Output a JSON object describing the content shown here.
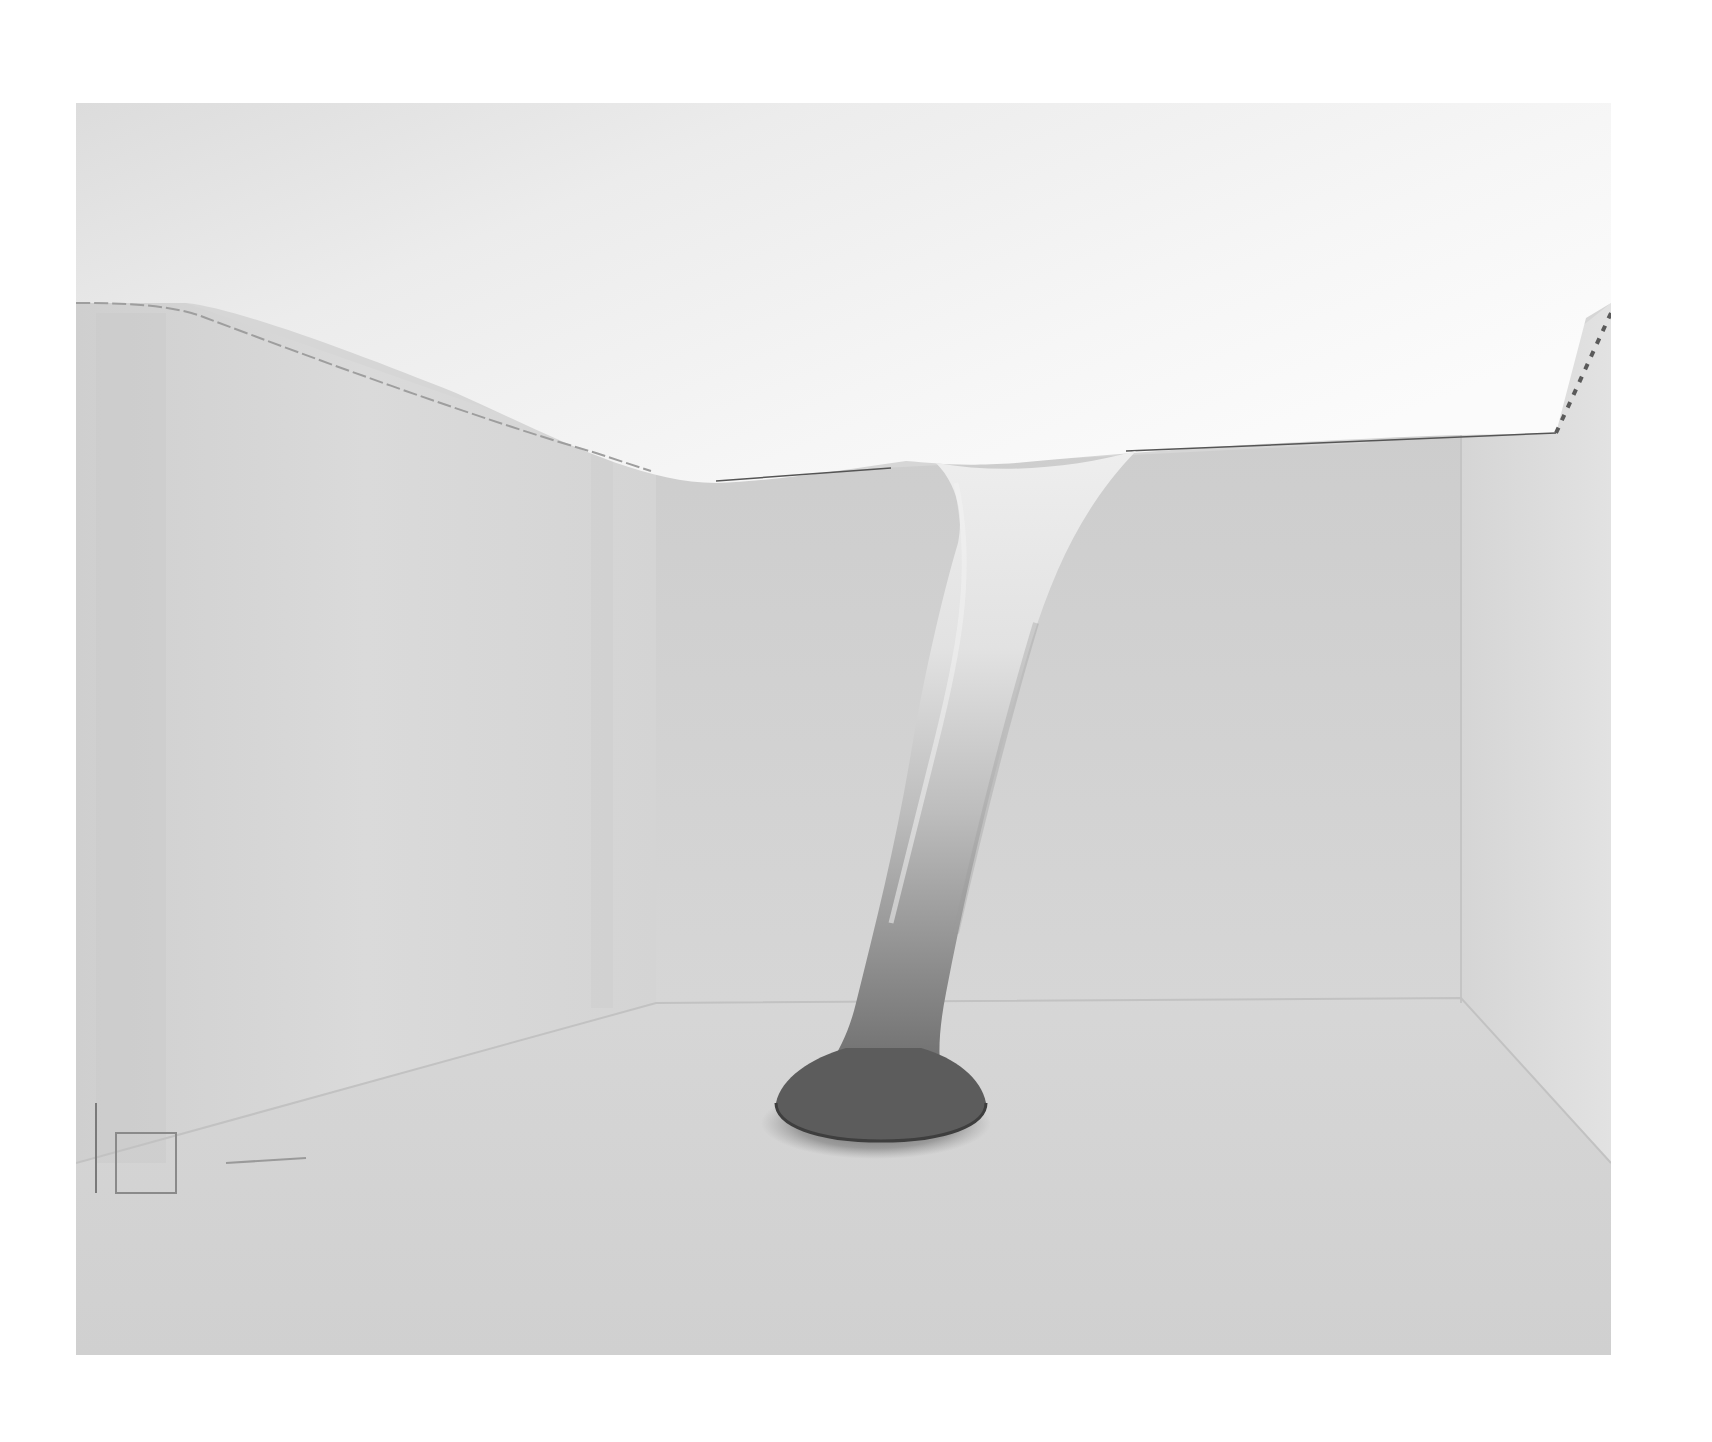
{
  "page": {
    "background": "#ffffff",
    "alt": "Black-and-white photograph of an empty white room with stretched fabric funnelling from the ceiling down to a dark weighted base on the floor"
  },
  "photo": {
    "frame": {
      "x": 76,
      "y": 103,
      "width": 1535,
      "height": 1252
    },
    "tones": {
      "ceiling_light": "#f4f4f4",
      "ceiling_mid": "#e6e6e6",
      "wall_left": "#d9d9d9",
      "wall_back": "#d3d3d3",
      "wall_right": "#dcdcdc",
      "floor": "#d4d4d4",
      "column_top": "#eaeaea",
      "column_bottom": "#6e6e6e",
      "base": "#5a5a5a",
      "edge_line": "#555555"
    },
    "subjects": [
      "stretched-fabric-ceiling",
      "fabric-column",
      "dark-weighted-base",
      "left-wall",
      "back-wall",
      "right-wall",
      "floor",
      "pinned-fabric-seam-left",
      "pinned-fabric-seam-right"
    ]
  }
}
